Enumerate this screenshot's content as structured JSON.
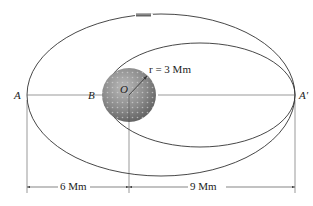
{
  "diagram": {
    "type": "orbital-mechanics-figure",
    "labels": {
      "point_A": "A",
      "point_B": "B",
      "point_O": "O",
      "point_A_prime": "A′",
      "radius": "r = 3 Mm",
      "dim_left": "6 Mm",
      "dim_right": "9 Mm"
    },
    "elements": {
      "outer_orbit": "elliptical orbit through A and A′",
      "inner_orbit": "elliptical orbit through B and A′",
      "planet": "planet centered at O",
      "satellite": "satellite on outer orbit"
    },
    "colors": {
      "line": "#333333",
      "planet_dark": "#6e6e6e",
      "planet_light": "#b8b8b8"
    }
  }
}
